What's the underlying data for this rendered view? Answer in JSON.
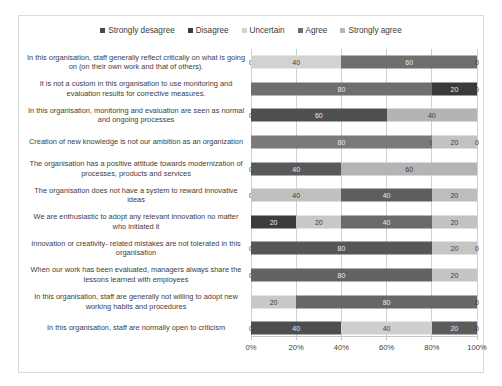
{
  "chart_data": {
    "type": "bar",
    "subtype": "stacked-horizontal-100",
    "title": "",
    "xlabel": "",
    "ylabel": "",
    "xlim": [
      0,
      100
    ],
    "grid": true,
    "legend_position": "top-center",
    "xticks": [
      "0%",
      "20%",
      "40%",
      "60%",
      "80%",
      "100%"
    ],
    "xtick_values": [
      0,
      20,
      40,
      60,
      80,
      100
    ],
    "colors": {
      "strongly_desagree": "#4a4a4a",
      "disagree": "#3a3a3a",
      "uncertain": "#d2d2d2",
      "agree": "#6e6e6e",
      "strongly_agree": "#b4b4b4"
    },
    "series": [
      {
        "name": "Strongly desagree",
        "color": "#4a4a4a",
        "values": [
          0,
          0,
          0,
          0,
          0,
          0,
          20,
          0,
          0,
          0,
          0
        ]
      },
      {
        "name": "Disagree",
        "color": "#3a3a3a",
        "values": [
          0,
          0,
          60,
          0,
          40,
          0,
          0,
          80,
          80,
          0,
          40
        ]
      },
      {
        "name": "Uncertain",
        "color": "#d2d2d2",
        "values": [
          40,
          0,
          0,
          0,
          0,
          40,
          20,
          0,
          0,
          20,
          40
        ]
      },
      {
        "name": "Agree",
        "color": "#6e6e6e",
        "values": [
          60,
          80,
          0,
          80,
          0,
          40,
          40,
          0,
          0,
          80,
          0
        ]
      },
      {
        "name": "Strongly agree",
        "color": "#b4b4b4",
        "values": [
          0,
          20,
          40,
          20,
          60,
          20,
          20,
          20,
          20,
          0,
          20
        ]
      }
    ],
    "categories": [
      "In this organisation, staff generally reflect critically on what is going on (on their own work and that of others).",
      "It is not a custom in this organisation to use monitoring and evaluation results for corrective measures.",
      "In this organisation, monitoring and evaluation are seen as normal and ongoing processes",
      "Creation of new knowledge is not our ambition as an organization",
      "The organisation has a positive attitude towards modernization of processes, products and services",
      "The organisation does not have a system to reward innovative ideas",
      "We are enthusiastic to adopt any relevant innovation no matter who initiated it",
      "Innovation or creativity- related mistakes are not tolerated in this organisation",
      "When our work has been evaluated, managers always share the lessons learned with employees",
      "In this organisation, staff are generally not willing to adopt new working habits and procedures",
      "In this organisation, staff are normally open to criticism"
    ],
    "rows": [
      {
        "label": "In this organisation, staff generally reflect critically on what is going on (on their own work and that of others).",
        "segments": [
          {
            "series": "Strongly desagree",
            "value": 0,
            "label": "0",
            "color": "#4a4a4a"
          },
          {
            "series": "Uncertain",
            "value": 40,
            "label": "40",
            "color": "#d2d2d2"
          },
          {
            "series": "Agree",
            "value": 60,
            "label": "60",
            "color": "#6e6e6e"
          },
          {
            "series": "Strongly agree",
            "value": 0,
            "label": "0",
            "color": "#b4b4b4"
          }
        ]
      },
      {
        "label": "It is not a custom in this organisation to use monitoring and evaluation results for corrective measures.",
        "segments": [
          {
            "series": "Agree",
            "value": 80,
            "label": "80",
            "color": "#6e6e6e"
          },
          {
            "series": "Disagree",
            "value": 20,
            "label": "20",
            "color": "#3a3a3a"
          },
          {
            "series": "Strongly agree",
            "value": 0,
            "label": "0",
            "color": "#b4b4b4"
          }
        ]
      },
      {
        "label": "In this organisation, monitoring and evaluation are seen as normal and ongoing processes",
        "segments": [
          {
            "series": "Strongly desagree",
            "value": 0,
            "label": "0",
            "color": "#4a4a4a"
          },
          {
            "series": "Disagree",
            "value": 60,
            "label": "60",
            "color": "#4f4f4f"
          },
          {
            "series": "Strongly agree",
            "value": 40,
            "label": "40",
            "color": "#b4b4b4"
          }
        ]
      },
      {
        "label": "Creation of new knowledge is not our ambition as an organization",
        "segments": [
          {
            "series": "Agree",
            "value": 80,
            "label": "80",
            "color": "#7a7a7a"
          },
          {
            "series": "Disagree",
            "value": 0,
            "label": "0",
            "color": "#3a3a3a"
          },
          {
            "series": "Strongly agree",
            "value": 20,
            "label": "20",
            "color": "#c2c2c2"
          },
          {
            "series": "Uncertain",
            "value": 0,
            "label": "0",
            "color": "#d2d2d2"
          }
        ]
      },
      {
        "label": "The organisation has a positive attitude towards modernization of processes, products and services",
        "segments": [
          {
            "series": "Strongly desagree",
            "value": 0,
            "label": "0",
            "color": "#4a4a4a"
          },
          {
            "series": "Disagree",
            "value": 40,
            "label": "40",
            "color": "#595959"
          },
          {
            "series": "Strongly agree",
            "value": 60,
            "label": "60",
            "color": "#b4b4b4"
          }
        ]
      },
      {
        "label": "The organisation does not have a system to reward innovative ideas",
        "segments": [
          {
            "series": "Strongly desagree",
            "value": 0,
            "label": "0",
            "color": "#4a4a4a"
          },
          {
            "series": "Uncertain",
            "value": 40,
            "label": "40",
            "color": "#c0c0c0"
          },
          {
            "series": "Agree",
            "value": 40,
            "label": "40",
            "color": "#5e5e5e"
          },
          {
            "series": "Strongly agree",
            "value": 20,
            "label": "20",
            "color": "#bdbdbd"
          }
        ]
      },
      {
        "label": "We are enthusiastic to adopt any relevant innovation no matter who initiated it",
        "segments": [
          {
            "series": "Strongly desagree",
            "value": 20,
            "label": "20",
            "color": "#3c3c3c"
          },
          {
            "series": "Uncertain",
            "value": 20,
            "label": "20",
            "color": "#c8c8c8"
          },
          {
            "series": "Agree",
            "value": 40,
            "label": "40",
            "color": "#6a6a6a"
          },
          {
            "series": "Strongly agree",
            "value": 20,
            "label": "20",
            "color": "#c2c2c2"
          }
        ]
      },
      {
        "label": "Innovation or creativity- related mistakes are not tolerated in this organisation",
        "segments": [
          {
            "series": "Strongly desagree",
            "value": 0,
            "label": "0",
            "color": "#4a4a4a"
          },
          {
            "series": "Disagree",
            "value": 80,
            "label": "80",
            "color": "#565656"
          },
          {
            "series": "Strongly agree",
            "value": 20,
            "label": "20",
            "color": "#c5c5c5"
          },
          {
            "series": "Uncertain",
            "value": 0,
            "label": "0",
            "color": "#d2d2d2"
          }
        ]
      },
      {
        "label": "When our work has been evaluated, managers always share the lessons learned with employees",
        "segments": [
          {
            "series": "Strongly desagree",
            "value": 0,
            "label": "0",
            "color": "#4a4a4a"
          },
          {
            "series": "Disagree",
            "value": 80,
            "label": "80",
            "color": "#636363"
          },
          {
            "series": "Strongly agree",
            "value": 20,
            "label": "20",
            "color": "#c5c5c5"
          }
        ]
      },
      {
        "label": "In this organisation, staff are generally not willing to adopt new working habits and procedures",
        "segments": [
          {
            "series": "Uncertain",
            "value": 20,
            "label": "20",
            "color": "#c8c8c8"
          },
          {
            "series": "Agree",
            "value": 80,
            "label": "80",
            "color": "#676767"
          },
          {
            "series": "Strongly agree",
            "value": 0,
            "label": "0",
            "color": "#b4b4b4"
          }
        ]
      },
      {
        "label": "In this organisation, staff are normally open to criticism",
        "segments": [
          {
            "series": "Strongly desagree",
            "value": 0,
            "label": "0",
            "color": "#4a4a4a"
          },
          {
            "series": "Disagree",
            "value": 40,
            "label": "40",
            "color": "#4e4e4e"
          },
          {
            "series": "Uncertain",
            "value": 40,
            "label": "40",
            "color": "#cfcfcf"
          },
          {
            "series": "Agree",
            "value": 20,
            "label": "20",
            "color": "#5c5c5c"
          },
          {
            "series": "Strongly agree",
            "value": 0,
            "label": "0",
            "color": "#b4b4b4"
          }
        ]
      }
    ]
  },
  "legend": {
    "items": [
      {
        "label": "Strongly desagree",
        "color": "#4a4a4a"
      },
      {
        "label": "Disagree",
        "color": "#3a3a3a"
      },
      {
        "label": "Uncertain",
        "color": "#d2d2d2"
      },
      {
        "label": "Agree",
        "color": "#6e6e6e"
      },
      {
        "label": "Strongly agree",
        "color": "#b4b4b4"
      }
    ]
  }
}
